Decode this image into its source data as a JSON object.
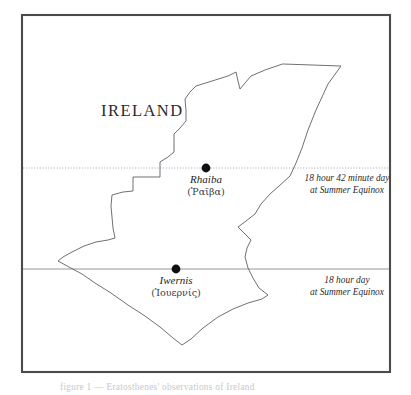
{
  "figure": {
    "country_label": "IRELAND",
    "caption": "figure 1 — Eratosthenes' observations of Ireland"
  },
  "cities": [
    {
      "id": "rhaiba",
      "latin_name": "Rhaiba",
      "greek_name": "(Ῥαῖβα)",
      "dot_x": 206,
      "dot_y": 168
    },
    {
      "id": "iwernis",
      "latin_name": "Iwernis",
      "greek_name": "(Ἰουερνίς)",
      "dot_x": 176,
      "dot_y": 269
    }
  ],
  "latitude_notes": [
    {
      "id": "upper",
      "line1": "18 hour 42 minute day",
      "line2": "at Summer Equinox",
      "line_y": 168,
      "line_style": "dotted"
    },
    {
      "id": "lower",
      "line1": "18 hour day",
      "line2": "at Summer Equinox",
      "line_y": 269,
      "line_style": "solid"
    }
  ],
  "colors": {
    "frame": "#4a4a4f",
    "coastline": "#53565c",
    "dotted_latitude": "#9aa0ad",
    "solid_latitude": "#8e9299",
    "city_dot": "#101014",
    "background": "#ffffff"
  },
  "frame": {
    "left": 22,
    "top": 15,
    "right": 390,
    "bottom": 372
  }
}
